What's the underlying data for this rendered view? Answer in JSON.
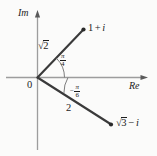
{
  "figure": {
    "type": "argand-diagram",
    "title": "",
    "background_color": "#fbfbfa",
    "ink_color": "#1c1c1c",
    "axis_color": "#9a9a9a",
    "axes": {
      "imaginary_label": "Im",
      "real_label": "Re",
      "origin_label": "0"
    },
    "points": [
      {
        "id": "point-1-plus-i",
        "label_plain": "1 + i",
        "label_real": "1",
        "label_op": "+",
        "label_imag": "i",
        "modulus_label": "2",
        "modulus_has_radical": true,
        "argument_numerator": "π",
        "argument_denominator": "4",
        "argument_sign": "",
        "modulus_value": 1.41421356,
        "argument_value_rad": 0.785398163,
        "cartesian": [
          1,
          1
        ]
      },
      {
        "id": "point-sqrt3-minus-i",
        "label_plain": "√3 − i",
        "label_real": "3",
        "label_op": "−",
        "label_imag": "i",
        "real_has_radical": true,
        "modulus_label": "2",
        "modulus_has_radical": false,
        "argument_numerator": "π",
        "argument_denominator": "6",
        "argument_sign": "−",
        "modulus_value": 2,
        "argument_value_rad": -0.523598776,
        "cartesian": [
          1.7320508,
          -1
        ]
      }
    ],
    "radical_glyph": "√",
    "imaginary_unit": "i"
  }
}
